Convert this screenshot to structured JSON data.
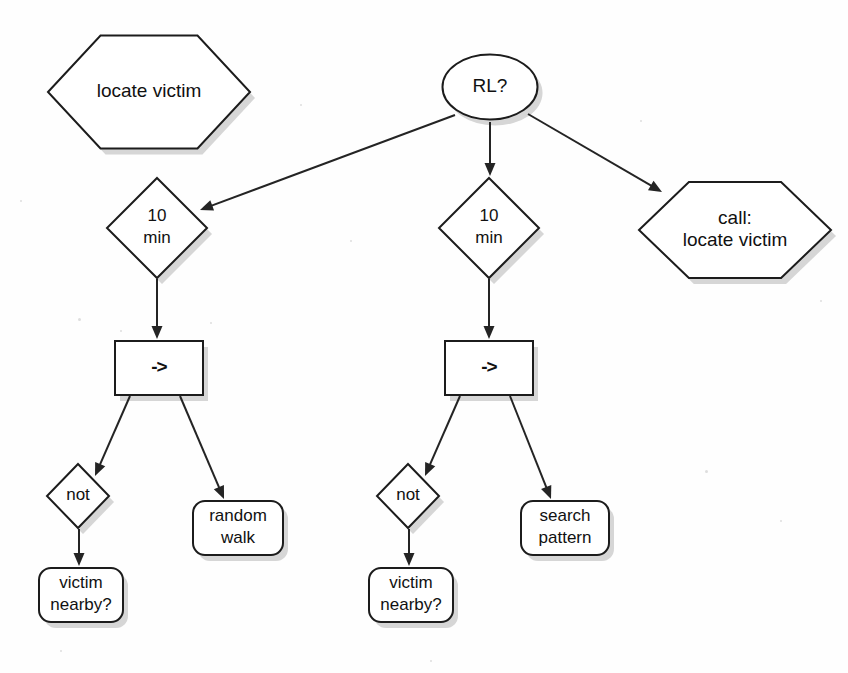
{
  "diagram": {
    "background_color": "#fefefe",
    "stroke_color": "#1c1c1c",
    "fill_color": "#ffffff",
    "shadow_color": "#b4b4b4",
    "nodes": [
      {
        "id": "locate-victim-root",
        "shape": "hexagon",
        "label": "locate victim",
        "lines": [
          "locate victim"
        ],
        "cx": 149,
        "cy": 92,
        "w": 202,
        "h": 113
      },
      {
        "id": "rl-condition",
        "shape": "ellipse",
        "label": "RL?",
        "lines": [
          "RL?"
        ],
        "cx": 490,
        "cy": 87,
        "w": 95,
        "h": 65
      },
      {
        "id": "ten-min-left",
        "shape": "diamond",
        "label": "10 min",
        "lines": [
          "10",
          "min"
        ],
        "cx": 157,
        "cy": 228,
        "w": 100,
        "h": 100
      },
      {
        "id": "ten-min-right",
        "shape": "diamond",
        "label": "10 min",
        "lines": [
          "10",
          "min"
        ],
        "cx": 489,
        "cy": 228,
        "w": 100,
        "h": 100
      },
      {
        "id": "call-locate-victim",
        "shape": "hexagon",
        "label": "call: locate victim",
        "lines": [
          "call:",
          "locate victim"
        ],
        "cx": 735,
        "cy": 230,
        "w": 192,
        "h": 96
      },
      {
        "id": "sequence-left",
        "shape": "rect",
        "label": "->",
        "lines": [
          "->"
        ],
        "cx": 159,
        "cy": 368,
        "w": 88,
        "h": 54
      },
      {
        "id": "sequence-right",
        "shape": "rect",
        "label": "->",
        "lines": [
          "->"
        ],
        "cx": 489,
        "cy": 368,
        "w": 88,
        "h": 54
      },
      {
        "id": "not-left",
        "shape": "diamond",
        "label": "not",
        "lines": [
          "not"
        ],
        "cx": 78,
        "cy": 496,
        "w": 62,
        "h": 64
      },
      {
        "id": "not-right",
        "shape": "diamond",
        "label": "not",
        "lines": [
          "not"
        ],
        "cx": 408,
        "cy": 496,
        "w": 62,
        "h": 64
      },
      {
        "id": "random-walk",
        "shape": "roundrect",
        "label": "random walk",
        "lines": [
          "random",
          "walk"
        ],
        "cx": 238,
        "cy": 528,
        "w": 90,
        "h": 54
      },
      {
        "id": "search-pattern",
        "shape": "roundrect",
        "label": "search pattern",
        "lines": [
          "search",
          "pattern"
        ],
        "cx": 565,
        "cy": 528,
        "w": 88,
        "h": 54
      },
      {
        "id": "victim-nearby-left",
        "shape": "roundrect",
        "label": "victim nearby?",
        "lines": [
          "victim",
          "nearby?"
        ],
        "cx": 81,
        "cy": 595,
        "w": 84,
        "h": 54
      },
      {
        "id": "victim-nearby-right",
        "shape": "roundrect",
        "label": "victim nearby?",
        "lines": [
          "victim",
          "nearby?"
        ],
        "cx": 411,
        "cy": 595,
        "w": 84,
        "h": 54
      }
    ],
    "edges": [
      {
        "id": "edge-rl-to-ten-min-left",
        "from": "rl-condition",
        "to": "ten-min-left",
        "x1": 455,
        "y1": 115,
        "x2": 200,
        "y2": 210
      },
      {
        "id": "edge-rl-to-ten-min-right",
        "from": "rl-condition",
        "to": "ten-min-right",
        "x1": 490,
        "y1": 122,
        "x2": 490,
        "y2": 176
      },
      {
        "id": "edge-rl-to-call",
        "from": "rl-condition",
        "to": "call-locate-victim",
        "x1": 528,
        "y1": 114,
        "x2": 662,
        "y2": 192
      },
      {
        "id": "edge-ten-min-left-to-seq",
        "from": "ten-min-left",
        "to": "sequence-left",
        "x1": 157,
        "y1": 279,
        "x2": 157,
        "y2": 339
      },
      {
        "id": "edge-ten-min-right-to-seq",
        "from": "ten-min-right",
        "to": "sequence-right",
        "x1": 489,
        "y1": 279,
        "x2": 489,
        "y2": 339
      },
      {
        "id": "edge-seq-left-to-not",
        "from": "sequence-left",
        "to": "not-left",
        "x1": 130,
        "y1": 396,
        "x2": 95,
        "y2": 476
      },
      {
        "id": "edge-seq-left-to-random",
        "from": "sequence-left",
        "to": "random-walk",
        "x1": 180,
        "y1": 396,
        "x2": 224,
        "y2": 499
      },
      {
        "id": "edge-seq-right-to-not",
        "from": "sequence-right",
        "to": "not-right",
        "x1": 460,
        "y1": 396,
        "x2": 425,
        "y2": 476
      },
      {
        "id": "edge-seq-right-to-search",
        "from": "sequence-right",
        "to": "search-pattern",
        "x1": 510,
        "y1": 396,
        "x2": 551,
        "y2": 499
      },
      {
        "id": "edge-not-left-to-victim",
        "from": "not-left",
        "to": "victim-nearby-left",
        "x1": 79,
        "y1": 529,
        "x2": 79,
        "y2": 566
      },
      {
        "id": "edge-not-right-to-victim",
        "from": "not-right",
        "to": "victim-nearby-right",
        "x1": 409,
        "y1": 529,
        "x2": 409,
        "y2": 566
      }
    ]
  }
}
